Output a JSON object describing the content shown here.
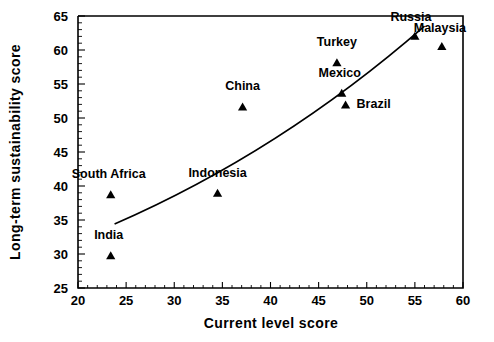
{
  "chart_data": {
    "type": "scatter",
    "title": "",
    "xlabel": "Current  level score",
    "ylabel": "Long-term sustainability score",
    "xlim": [
      20,
      60
    ],
    "ylim": [
      25,
      65
    ],
    "xticks": [
      20,
      25,
      30,
      35,
      40,
      45,
      50,
      55,
      60
    ],
    "xticklabels": [
      "20",
      "25",
      "30",
      "35",
      "40",
      "45",
      "50",
      "55",
      "60"
    ],
    "yticks": [
      25,
      30,
      35,
      40,
      45,
      50,
      55,
      60,
      65
    ],
    "yticklabels": [
      "25",
      "30",
      "35",
      "40",
      "45",
      "50",
      "55",
      "60",
      "65"
    ],
    "grid": false,
    "legend": "none",
    "marker": "triangle",
    "marker_color": "#000000",
    "points": [
      {
        "name": "India",
        "x": 23.4,
        "y": 29.8,
        "label_dx": -2,
        "label_dy": -16
      },
      {
        "name": "South Africa",
        "x": 23.4,
        "y": 38.8,
        "label_dx": -2,
        "label_dy": -16
      },
      {
        "name": "Indonesia",
        "x": 34.5,
        "y": 39.0,
        "label_dx": 0,
        "label_dy": -16
      },
      {
        "name": "China",
        "x": 37.1,
        "y": 51.7,
        "label_dx": 0,
        "label_dy": -16
      },
      {
        "name": "Turkey",
        "x": 46.9,
        "y": 58.2,
        "label_dx": 0,
        "label_dy": -16
      },
      {
        "name": "Mexico",
        "x": 47.4,
        "y": 53.7,
        "label_dx": -2,
        "label_dy": -16
      },
      {
        "name": "Brazil",
        "x": 47.8,
        "y": 52.0,
        "label_dx": 11,
        "label_dy": 4
      },
      {
        "name": "Russia",
        "x": 55.0,
        "y": 62.1,
        "label_dx": -4,
        "label_dy": -15
      },
      {
        "name": "Malaysia",
        "x": 57.8,
        "y": 60.6,
        "label_dx": -2,
        "label_dy": -14
      }
    ],
    "trend": {
      "type": "curve",
      "start": [
        23.8,
        34.4
      ],
      "end": [
        56.0,
        63.5
      ],
      "control": [
        41.0,
        45.0
      ]
    }
  }
}
